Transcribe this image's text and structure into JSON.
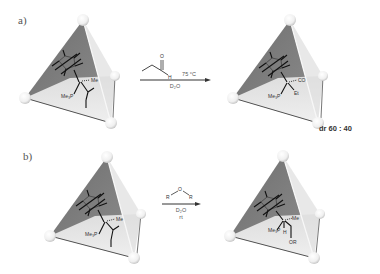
{
  "panels": [
    {
      "id": "a",
      "label": "a)",
      "reactant": {
        "ligands": {
          "phosphine": "Me₃P",
          "axial": "Me",
          "metal": "Ir"
        }
      },
      "reagent": {
        "name": "propanal",
        "atoms": {
          "oxygen": "O",
          "hydrogen": "H"
        }
      },
      "conditions": {
        "above": "75 °C",
        "below": "D₂O"
      },
      "product": {
        "ligands": {
          "phosphine": "Me₃P",
          "axial": "CO",
          "substituent": "Et",
          "metal": "Ir"
        }
      },
      "result": "dr 60 : 40"
    },
    {
      "id": "b",
      "label": "b)",
      "reactant": {
        "ligands": {
          "phosphine": "Me₃P",
          "axial": "Me",
          "metal": "Ir"
        }
      },
      "reagent": {
        "name": "ether",
        "atoms": {
          "left": "R",
          "oxygen": "O",
          "right": "R"
        }
      },
      "conditions": {
        "below1": "D₂O",
        "below2": "rt"
      },
      "product": {
        "ligands": {
          "phosphine": "Me₃P",
          "axial": "Me",
          "hydride": "H",
          "substituent": "OR",
          "metal": "Ir"
        }
      }
    }
  ],
  "colors": {
    "face_dark": "#7a7a7a",
    "face_light": "#f4f4f4",
    "edge": "#5a5a5a",
    "vertex": "#ffffff",
    "ink": "#222222"
  }
}
